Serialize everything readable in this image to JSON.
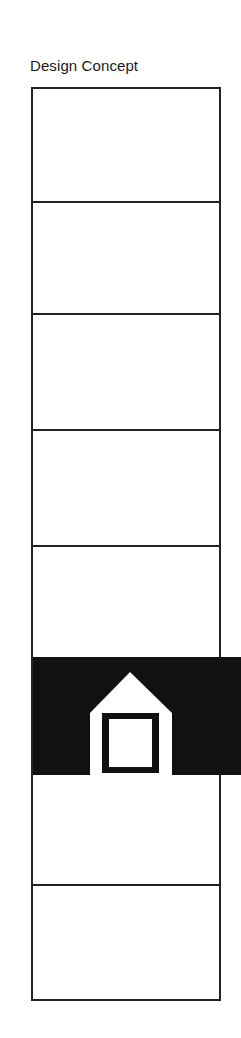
{
  "title": "Design Concept",
  "diagram": {
    "type": "stacked-panels",
    "panel_count": 8,
    "highlighted_panel_index": 5,
    "highlight_icon": "house-icon",
    "colors": {
      "line": "#222222",
      "band": "#111111",
      "background": "#ffffff"
    }
  }
}
